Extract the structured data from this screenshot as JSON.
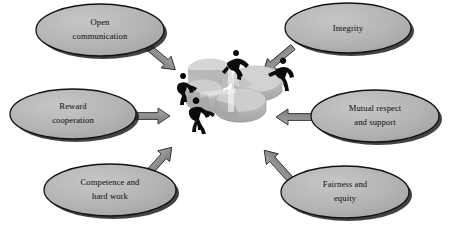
{
  "diagram": {
    "type": "hub-and-spoke",
    "center": {
      "name": "exploded-pie-puzzle",
      "description": "Three-dimensional exploded pie chart with four black human silhouettes pushing the wedges together",
      "wedge_count": 4,
      "figure_count": 4,
      "top_fill": "#d8d8d8",
      "side_fill": "#b8b8b8",
      "shade_fill": "#a9a9a9",
      "figure_fill": "#0a0a0a"
    },
    "style": {
      "background": "#ffffff",
      "node_fill": "#b3b3b3",
      "node_fill_light": "#c6c6c6",
      "node_stroke": "#111111",
      "node_shadow": "#1a1a1a",
      "arrow_fill": "#8e8e8e",
      "arrow_fill_light": "#a6a6a6",
      "arrow_stroke": "#2b2b2b",
      "text_color": "#0d0d0d"
    },
    "nodes": [
      {
        "id": "open-communication",
        "lines": [
          "Open",
          "communication"
        ],
        "position": "top-left",
        "cx": 100,
        "cy": 30,
        "rx": 64,
        "ry": 26
      },
      {
        "id": "integrity",
        "lines": [
          "Integrity"
        ],
        "position": "top-right",
        "cx": 348,
        "cy": 28,
        "rx": 63,
        "ry": 25
      },
      {
        "id": "reward-cooperation",
        "lines": [
          "Reward",
          "cooperation"
        ],
        "position": "middle-left",
        "cx": 73,
        "cy": 114,
        "rx": 63,
        "ry": 25
      },
      {
        "id": "mutual-respect-and-support",
        "lines": [
          "Mutual respect",
          "and support"
        ],
        "position": "middle-right",
        "cx": 375,
        "cy": 116,
        "rx": 64,
        "ry": 26
      },
      {
        "id": "competence-and-hard-work",
        "lines": [
          "Competence and",
          "hard work"
        ],
        "position": "bottom-left",
        "cx": 110,
        "cy": 190,
        "rx": 66,
        "ry": 26
      },
      {
        "id": "fairness-and-equity",
        "lines": [
          "Fairness and",
          "equity"
        ],
        "position": "bottom-right",
        "cx": 345,
        "cy": 192,
        "rx": 64,
        "ry": 26
      }
    ],
    "arrows": [
      {
        "id": "arrow-open-communication",
        "from": "open-communication",
        "to": "center",
        "direction": "down-right"
      },
      {
        "id": "arrow-integrity",
        "from": "integrity",
        "to": "center",
        "direction": "down-left"
      },
      {
        "id": "arrow-reward-cooperation",
        "from": "reward-cooperation",
        "to": "center",
        "direction": "right"
      },
      {
        "id": "arrow-mutual-respect",
        "from": "mutual-respect-and-support",
        "to": "center",
        "direction": "left"
      },
      {
        "id": "arrow-competence",
        "from": "competence-and-hard-work",
        "to": "center",
        "direction": "up-right"
      },
      {
        "id": "arrow-fairness",
        "from": "fairness-and-equity",
        "to": "center",
        "direction": "up-left"
      }
    ]
  }
}
